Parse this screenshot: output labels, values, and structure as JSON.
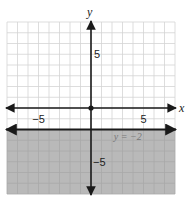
{
  "chart_data": {
    "type": "line",
    "title": "",
    "xlabel": "x",
    "ylabel": "y",
    "xlim": [
      -8,
      8
    ],
    "ylim": [
      -8,
      8
    ],
    "grid": true,
    "grid_step": 1,
    "x_tick_labels": [
      {
        "value": -5,
        "label": "−5"
      },
      {
        "value": 5,
        "label": "5"
      }
    ],
    "y_tick_labels": [
      {
        "value": 5,
        "label": "5"
      },
      {
        "value": -5,
        "label": "−5"
      }
    ],
    "origin_point": [
      0,
      0
    ],
    "series": [
      {
        "name": "y = −2",
        "kind": "horizontal-line",
        "equation": "y = −2",
        "y": -2,
        "line_style": "solid",
        "shaded_region": "below",
        "x": [
          -8,
          8
        ],
        "values": [
          -2,
          -2
        ]
      }
    ],
    "annotations": [
      {
        "text": "y = −2",
        "x": 3.5,
        "y": -2.6
      }
    ],
    "colors": {
      "shade": "#b9b9b9",
      "grid": "#d4d4d4",
      "grid_shaded": "#a8a8a8",
      "axis": "#1a1a1a",
      "boundary_line": "#1a1a1a"
    }
  },
  "labels": {
    "x_axis": "x",
    "y_axis": "y",
    "x_neg5": "−5",
    "x_pos5": "5",
    "y_pos5": "5",
    "y_neg5": "−5",
    "equation": "y = −2"
  }
}
